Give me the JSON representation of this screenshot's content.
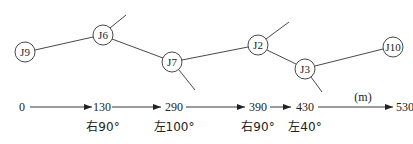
{
  "diagram": {
    "nodes": [
      {
        "id": "J9",
        "x": 25,
        "y": 52
      },
      {
        "id": "J6",
        "x": 103,
        "y": 35
      },
      {
        "id": "J7",
        "x": 172,
        "y": 62
      },
      {
        "id": "J2",
        "x": 258,
        "y": 45
      },
      {
        "id": "J3",
        "x": 305,
        "y": 69
      },
      {
        "id": "J10",
        "x": 393,
        "y": 47
      }
    ],
    "branches": [
      {
        "from": "J6",
        "to_x": 126,
        "to_y": 15
      },
      {
        "from": "J7",
        "to_x": 195,
        "to_y": 90
      },
      {
        "from": "J2",
        "to_x": 289,
        "to_y": 22
      },
      {
        "from": "J3",
        "to_x": 322,
        "to_y": 92
      }
    ],
    "chainage": {
      "unit": "(m)",
      "marks": [
        "0",
        "130",
        "290",
        "390",
        "430",
        "530"
      ],
      "turns": [
        {
          "at": "130",
          "label": "右90°"
        },
        {
          "at": "290",
          "label": "左100°"
        },
        {
          "at": "390",
          "label": "右90°"
        },
        {
          "at": "430",
          "label": "左40°"
        }
      ]
    }
  }
}
